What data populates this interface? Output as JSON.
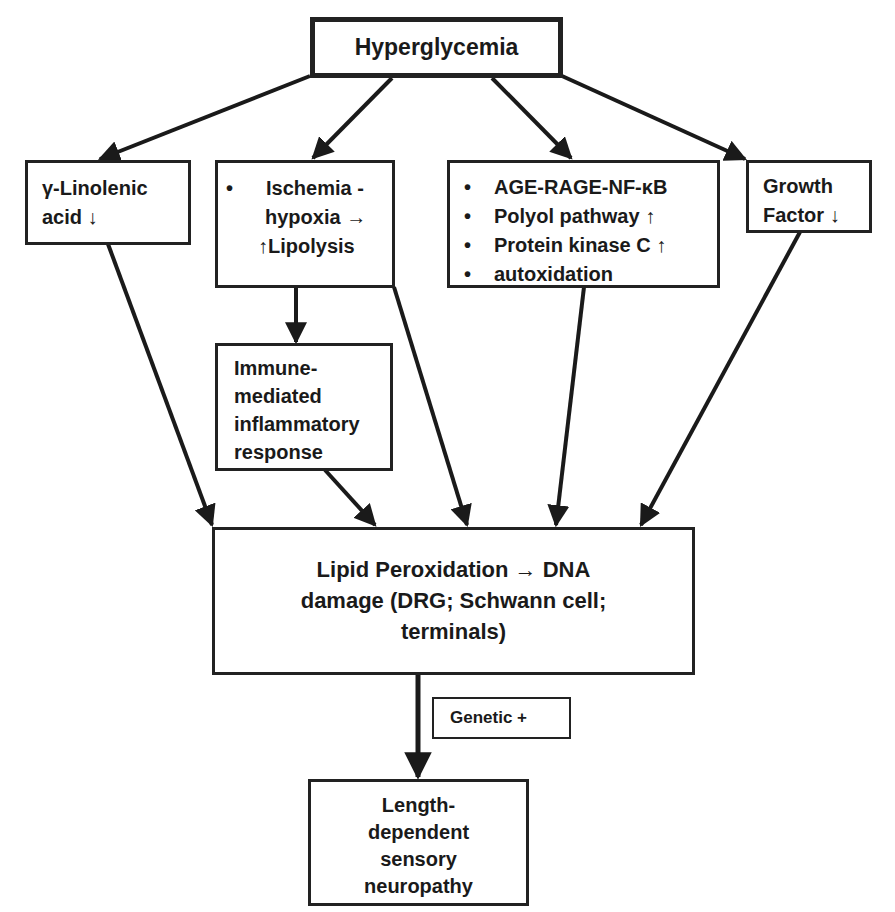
{
  "diagram": {
    "root": {
      "label": "Hyperglycemia"
    },
    "mechanisms": {
      "linolenic": {
        "lines": [
          "γ-Linolenic",
          "acid ↓"
        ]
      },
      "ischemia": {
        "bullet": "Ischemia -",
        "lines": [
          "hypoxia →",
          "↑Lipolysis"
        ]
      },
      "metabolic": {
        "items": [
          "AGE-RAGE-NF-κB",
          "Polyol pathway ↑",
          "Protein kinase C ↑",
          "autoxidation"
        ]
      },
      "growth_factor": {
        "lines": [
          "Growth",
          "Factor ↓"
        ]
      }
    },
    "immune": {
      "lines": [
        "Immune-",
        "mediated",
        "inflammatory",
        "response"
      ]
    },
    "lipid": {
      "lines": [
        "Lipid Peroxidation → DNA",
        "damage (DRG; Schwann cell;",
        "terminals)"
      ]
    },
    "genetic": {
      "label": "Genetic +"
    },
    "outcome": {
      "lines": [
        "Length-",
        "dependent",
        "sensory",
        "neuropathy"
      ]
    },
    "edges": [
      {
        "from": "Hyperglycemia",
        "to": "γ-Linolenic acid ↓"
      },
      {
        "from": "Hyperglycemia",
        "to": "Ischemia - hypoxia → ↑Lipolysis"
      },
      {
        "from": "Hyperglycemia",
        "to": "AGE-RAGE-NF-κB / Polyol / PKC / autoxidation"
      },
      {
        "from": "Hyperglycemia",
        "to": "Growth Factor ↓"
      },
      {
        "from": "Ischemia - hypoxia → ↑Lipolysis",
        "to": "Immune-mediated inflammatory response"
      },
      {
        "from": "γ-Linolenic acid ↓",
        "to": "Lipid Peroxidation → DNA damage"
      },
      {
        "from": "Immune-mediated inflammatory response",
        "to": "Lipid Peroxidation → DNA damage"
      },
      {
        "from": "Ischemia - hypoxia → ↑Lipolysis",
        "to": "Lipid Peroxidation → DNA damage"
      },
      {
        "from": "AGE-RAGE-NF-κB / Polyol / PKC / autoxidation",
        "to": "Lipid Peroxidation → DNA damage"
      },
      {
        "from": "Growth Factor ↓",
        "to": "Lipid Peroxidation → DNA damage"
      },
      {
        "from": "Lipid Peroxidation → DNA damage",
        "to": "Length-dependent sensory neuropathy",
        "modifier": "Genetic +"
      }
    ]
  }
}
